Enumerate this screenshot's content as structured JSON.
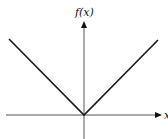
{
  "diagram": {
    "y_axis_label": "f(x)",
    "x_axis_label": "x",
    "function": "f(x) = |x|",
    "colors": {
      "line": "#1a1a1a",
      "axis": "#555555"
    }
  }
}
